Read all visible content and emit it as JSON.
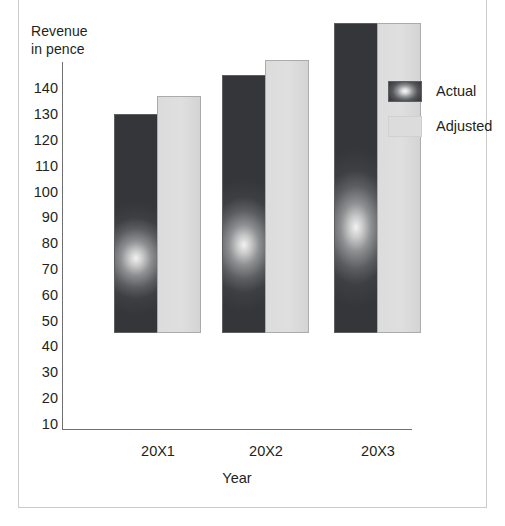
{
  "chart_data": {
    "type": "bar",
    "title": "",
    "xlabel": "Year",
    "ylabel": "Revenue\nin pence",
    "categories": [
      "20X1",
      "20X2",
      "20X3"
    ],
    "series": [
      {
        "name": "Actual",
        "values": [
          93,
          108,
          128
        ],
        "color": "#3d3f42"
      },
      {
        "name": "Adjusted",
        "values": [
          100,
          114,
          128
        ],
        "color": "#dcdcdc"
      }
    ],
    "yticks": [
      140,
      130,
      120,
      110,
      100,
      90,
      80,
      70,
      60,
      50,
      40,
      30,
      20,
      10
    ],
    "ylim": [
      0,
      145
    ],
    "grid": false,
    "legend_position": "top-right"
  },
  "axes": {
    "y_title": "Revenue\nin pence",
    "x_title": "Year"
  },
  "legend": {
    "items": [
      {
        "label": "Actual",
        "swatch": "actual-swatch"
      },
      {
        "label": "Adjusted",
        "swatch": "adjusted-swatch"
      }
    ]
  }
}
